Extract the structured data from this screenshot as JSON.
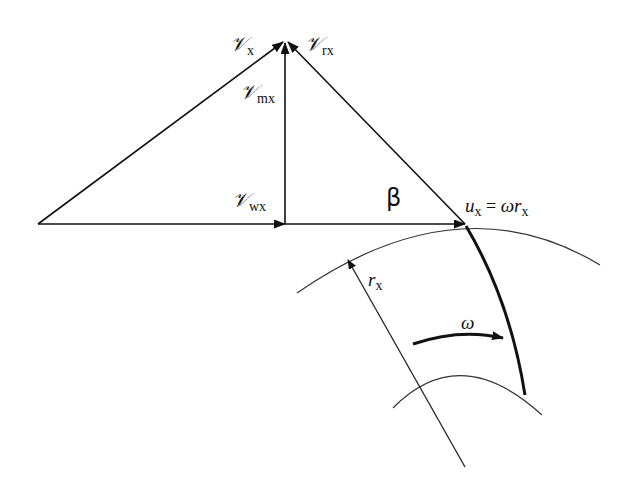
{
  "diagram": {
    "type": "velocity-triangle",
    "labels": {
      "v_x": {
        "symbol": "𝒱",
        "sub": "x"
      },
      "v_rx": {
        "symbol": "𝒱",
        "sub": "rx"
      },
      "v_mx": {
        "symbol": "𝒱",
        "sub": "mx"
      },
      "v_wx": {
        "symbol": "𝒱",
        "sub": "wx"
      },
      "beta": "β",
      "u_x": {
        "lhs": "u",
        "lhs_sub": "x",
        "eq": " = ",
        "rhs1": "ω",
        "rhs2": "r",
        "rhs_sub": "x"
      },
      "r_x": {
        "symbol": "r",
        "sub": "x"
      },
      "omega": "ω"
    },
    "colors": {
      "line": "#111111",
      "background": "#ffffff"
    }
  }
}
